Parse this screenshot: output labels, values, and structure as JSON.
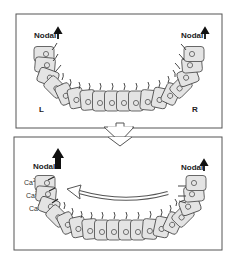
{
  "panels": [
    {
      "id": "before",
      "nodal_left": {
        "label": "Nodal",
        "arrow": "small-up-arrow"
      },
      "nodal_right": {
        "label": "Nodal",
        "arrow": "small-up-arrow"
      },
      "side_left": "L",
      "side_right": "R",
      "cilia_direction": "upright"
    },
    {
      "id": "after",
      "nodal_left": {
        "label": "Nodal",
        "arrow": "large-up-arrow"
      },
      "nodal_right": {
        "label": "Nodal",
        "arrow": "small-up-arrow"
      },
      "calcium_labels": [
        "Ca2+",
        "Ca2+",
        "Ca2+"
      ],
      "flow_arrow": "leftward-curved-hollow-arrow",
      "cilia_direction": "tilted"
    }
  ],
  "transition_arrow": "hollow-down-arrow",
  "colors": {
    "cell_fill": "#e4e4e4",
    "cell_stroke": "#444444",
    "frame_stroke": "#555555",
    "text": "#222222"
  }
}
